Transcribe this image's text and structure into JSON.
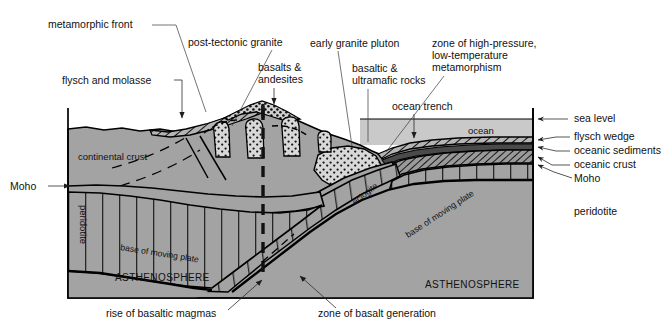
{
  "figure": {
    "background_color": "#ffffff"
  },
  "colors": {
    "crust_fill": "#a3a3a3",
    "ocean_fill": "#c9c9c9",
    "asthenosphere_fill": "#a3a3a3",
    "sky_fill": "#ffffff",
    "outline": "#000000",
    "text": "#111111",
    "leader": "#2b2b2b"
  },
  "callouts_top": [
    {
      "id": "metamorphic-front",
      "label": "metamorphic front"
    },
    {
      "id": "post-tectonic-granite",
      "label": "post-tectonic granite"
    },
    {
      "id": "early-granite-pluton",
      "label": "early granite pluton"
    },
    {
      "id": "flysch-and-molasse",
      "label": "flysch and molasse"
    },
    {
      "id": "basalts-and-andesites",
      "label_line1": "basalts &",
      "label_line2": "andesites"
    },
    {
      "id": "basaltic-ultramafic",
      "label_line1": "basaltic &",
      "label_line2": "ultramafic rocks"
    },
    {
      "id": "ocean-trench",
      "label": "ocean trench"
    },
    {
      "id": "hp-lt-metamorphism",
      "label_line1": "zone of high-pressure,",
      "label_line2": "low-temperature",
      "label_line3": "metamorphism"
    }
  ],
  "callouts_right": [
    {
      "id": "sea-level",
      "label": "sea level"
    },
    {
      "id": "flysch-wedge",
      "label": "flysch wedge"
    },
    {
      "id": "oceanic-sediments",
      "label": "oceanic sediments"
    },
    {
      "id": "oceanic-crust",
      "label": "oceanic crust"
    },
    {
      "id": "moho-right",
      "label": "Moho"
    },
    {
      "id": "peridotite-right",
      "label": "peridotite"
    }
  ],
  "callouts_left": [
    {
      "id": "moho-left",
      "label": "Moho"
    }
  ],
  "callouts_bottom": [
    {
      "id": "rise-of-basaltic-magmas",
      "label": "rise of basaltic magmas"
    },
    {
      "id": "zone-of-basalt-generation",
      "label": "zone of basalt generation"
    }
  ],
  "inner_labels": [
    {
      "id": "continental-crust",
      "label": "continental crust"
    },
    {
      "id": "ocean-water",
      "label": "ocean"
    },
    {
      "id": "peridotite-left",
      "label": "peridotite"
    },
    {
      "id": "eclogite",
      "label": "eclogite"
    },
    {
      "id": "base-of-moving-plate-left",
      "label": "base of moving plate"
    },
    {
      "id": "base-of-moving-plate-right",
      "label": "base of moving plate"
    },
    {
      "id": "asthenosphere-left",
      "label": "ASTHENOSPHERE"
    },
    {
      "id": "asthenosphere-right",
      "label": "ASTHENOSPHERE"
    }
  ]
}
